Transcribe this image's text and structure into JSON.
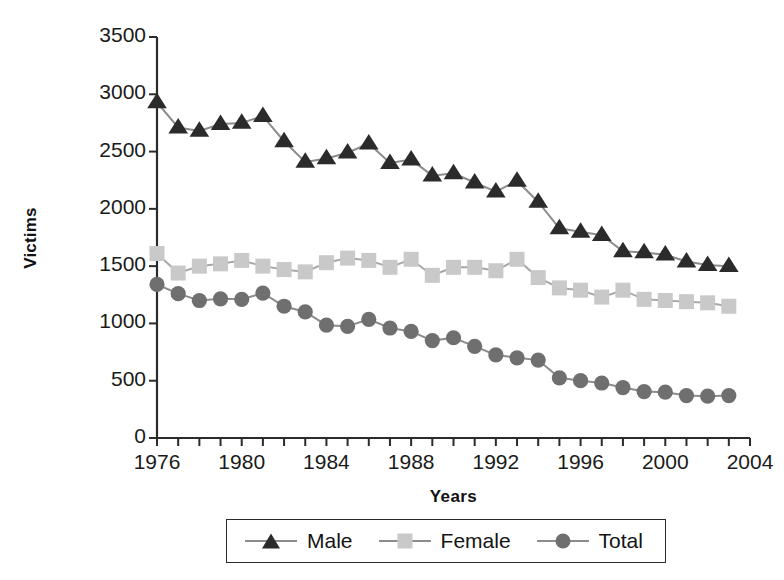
{
  "chart_data": {
    "type": "line",
    "title": "",
    "xlabel": "Years",
    "ylabel": "Victims",
    "xlim": [
      1976,
      2004
    ],
    "ylim": [
      0,
      3500
    ],
    "grid": false,
    "legend_position": "below-axes",
    "xticks": [
      1976,
      1977,
      1978,
      1979,
      1980,
      1981,
      1982,
      1983,
      1984,
      1985,
      1986,
      1987,
      1988,
      1989,
      1990,
      1991,
      1992,
      1993,
      1994,
      1995,
      1996,
      1997,
      1998,
      1999,
      2000,
      2001,
      2002,
      2003,
      2004
    ],
    "xtick_labels": [
      "1976",
      "1980",
      "1984",
      "1988",
      "1992",
      "1996",
      "2000",
      "2004"
    ],
    "xtick_labeled_values": [
      1976,
      1980,
      1984,
      1988,
      1992,
      1996,
      2000,
      2004
    ],
    "yticks": [
      0,
      500,
      1000,
      1500,
      2000,
      2500,
      3000,
      3500
    ],
    "ytick_labels": [
      "0",
      "500",
      "1000",
      "1500",
      "2000",
      "2500",
      "3000",
      "3500"
    ],
    "x": [
      1976,
      1977,
      1978,
      1979,
      1980,
      1981,
      1982,
      1983,
      1984,
      1985,
      1986,
      1987,
      1988,
      1989,
      1990,
      1991,
      1992,
      1993,
      1994,
      1995,
      1996,
      1997,
      1998,
      1999,
      2000,
      2001,
      2002,
      2003
    ],
    "series": [
      {
        "name": "Male",
        "marker": "triangle",
        "color": "#2b2b2b",
        "line_color": "#8c8c8c",
        "values": [
          2930,
          2710,
          2680,
          2740,
          2750,
          2810,
          2590,
          2410,
          2440,
          2490,
          2570,
          2400,
          2430,
          2290,
          2310,
          2230,
          2150,
          2245,
          2060,
          1830,
          1800,
          1770,
          1630,
          1620,
          1600,
          1540,
          1510,
          1500
        ]
      },
      {
        "name": "Female",
        "marker": "square",
        "color": "#c9c9c9",
        "line_color": "#a8a8a8",
        "values": [
          1610,
          1440,
          1500,
          1520,
          1550,
          1500,
          1470,
          1450,
          1530,
          1570,
          1550,
          1490,
          1560,
          1420,
          1490,
          1490,
          1460,
          1560,
          1400,
          1310,
          1290,
          1230,
          1290,
          1210,
          1200,
          1190,
          1180,
          1150
        ]
      },
      {
        "name": "Total",
        "marker": "circle",
        "color": "#6f6f6f",
        "line_color": "#8c8c8c",
        "values": [
          1340,
          1260,
          1200,
          1215,
          1210,
          1265,
          1150,
          1100,
          985,
          975,
          1035,
          960,
          930,
          850,
          875,
          800,
          725,
          700,
          680,
          525,
          500,
          480,
          440,
          405,
          400,
          370,
          365,
          370
        ]
      }
    ]
  },
  "legend": {
    "items": [
      {
        "label": "Male",
        "marker": "triangle-marker"
      },
      {
        "label": "Female",
        "marker": "square-marker"
      },
      {
        "label": "Total",
        "marker": "circle-marker"
      }
    ]
  },
  "colors": {
    "male": "#2b2b2b",
    "female": "#c9c9c9",
    "total": "#6f6f6f",
    "line": "#8c8c8c",
    "axis": "#2b2b2b",
    "text": "#141414",
    "background": "#ffffff"
  }
}
